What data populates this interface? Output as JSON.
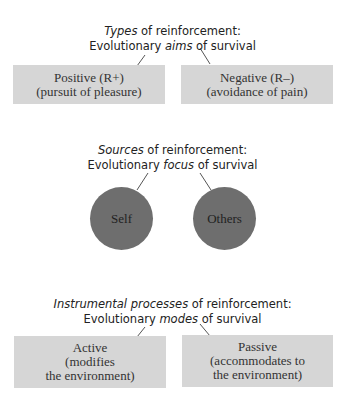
{
  "section1": {
    "header_line1_italic": "Types",
    "header_line1_rest": " of reinforcement:",
    "header_line2_pre": "Evolutionary ",
    "header_line2_italic": "aims",
    "header_line2_post": " of survival",
    "boxes": [
      {
        "line1": "Positive (R+)",
        "line2": "(pursuit of pleasure)"
      },
      {
        "line1": "Negative (R–)",
        "line2": "(avoidance of pain)"
      }
    ]
  },
  "section2": {
    "header_line1_italic": "Sources",
    "header_line1_rest": " of reinforcement:",
    "header_line2_pre": "Evolutionary ",
    "header_line2_italic": "focus",
    "header_line2_post": " of survival",
    "circles": [
      {
        "label": "Self"
      },
      {
        "label": "Others"
      }
    ]
  },
  "section3": {
    "header_line1_italic": "Instrumental processes",
    "header_line1_rest": " of reinforcement:",
    "header_line2_pre": "Evolutionary ",
    "header_line2_italic": "modes",
    "header_line2_post": " of survival",
    "boxes": [
      {
        "line1": "Active",
        "line2": "(modifies",
        "line3": "the environment)"
      },
      {
        "line1": "Passive",
        "line2": "(accommodates to",
        "line3": "the environment)"
      }
    ]
  },
  "colors": {
    "box": "#d6d6d6",
    "circle": "#6e6e6e",
    "line": "#555555"
  }
}
